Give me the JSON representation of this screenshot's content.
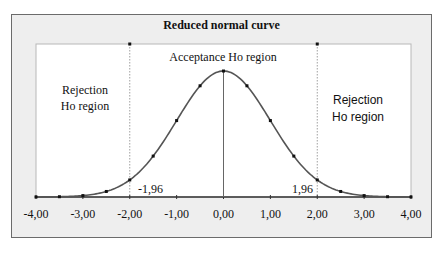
{
  "chart_data": {
    "type": "line",
    "title": "Reduced normal curve",
    "xlabel": "",
    "ylabel": "",
    "xlim": [
      -4,
      4
    ],
    "ylim": [
      0,
      0.45
    ],
    "grid": false,
    "legend": null,
    "x_tick_labels": [
      "-4,00",
      "-3,00",
      "-2,00",
      "-1,00",
      "0,00",
      "1,00",
      "2,00",
      "3,00",
      "4,00"
    ],
    "x_ticks": [
      -4,
      -3,
      -2,
      -1,
      0,
      1,
      2,
      3,
      4
    ],
    "series": [
      {
        "name": "Standard normal density",
        "x": [
          -4,
          -3.5,
          -3,
          -2.5,
          -2,
          -1.5,
          -1,
          -0.5,
          0,
          0.5,
          1,
          1.5,
          2,
          2.5,
          3,
          3.5,
          4
        ],
        "values": [
          0.0001,
          0.0009,
          0.0044,
          0.0175,
          0.054,
          0.1295,
          0.242,
          0.3521,
          0.3989,
          0.3521,
          0.242,
          0.1295,
          0.054,
          0.0175,
          0.0044,
          0.0009,
          0.0001
        ]
      }
    ],
    "critical_values": [
      -1.96,
      1.96
    ],
    "annotations": [
      {
        "text": "Acceptance Ho region",
        "x": 0
      },
      {
        "text": "Rejection Ho region",
        "x": -3,
        "side": "left"
      },
      {
        "text": "Rejection Ho region",
        "x": 3,
        "side": "right"
      },
      {
        "text": "-1,96",
        "x": -1.96
      },
      {
        "text": "1,96",
        "x": 1.96
      }
    ]
  },
  "labels": {
    "title": "Reduced normal curve",
    "acceptance": "Acceptance Ho region",
    "rejection_left_line1": "Rejection",
    "rejection_left_line2": "Ho region",
    "rejection_right_line1": "Rejection",
    "rejection_right_line2": "Ho region",
    "crit_left": "-1,96",
    "crit_right": "1,96"
  },
  "colors": {
    "curve": "#555555",
    "frame_bg": "#eeeeee",
    "plot_bg": "#ffffff",
    "axis": "#333333"
  }
}
